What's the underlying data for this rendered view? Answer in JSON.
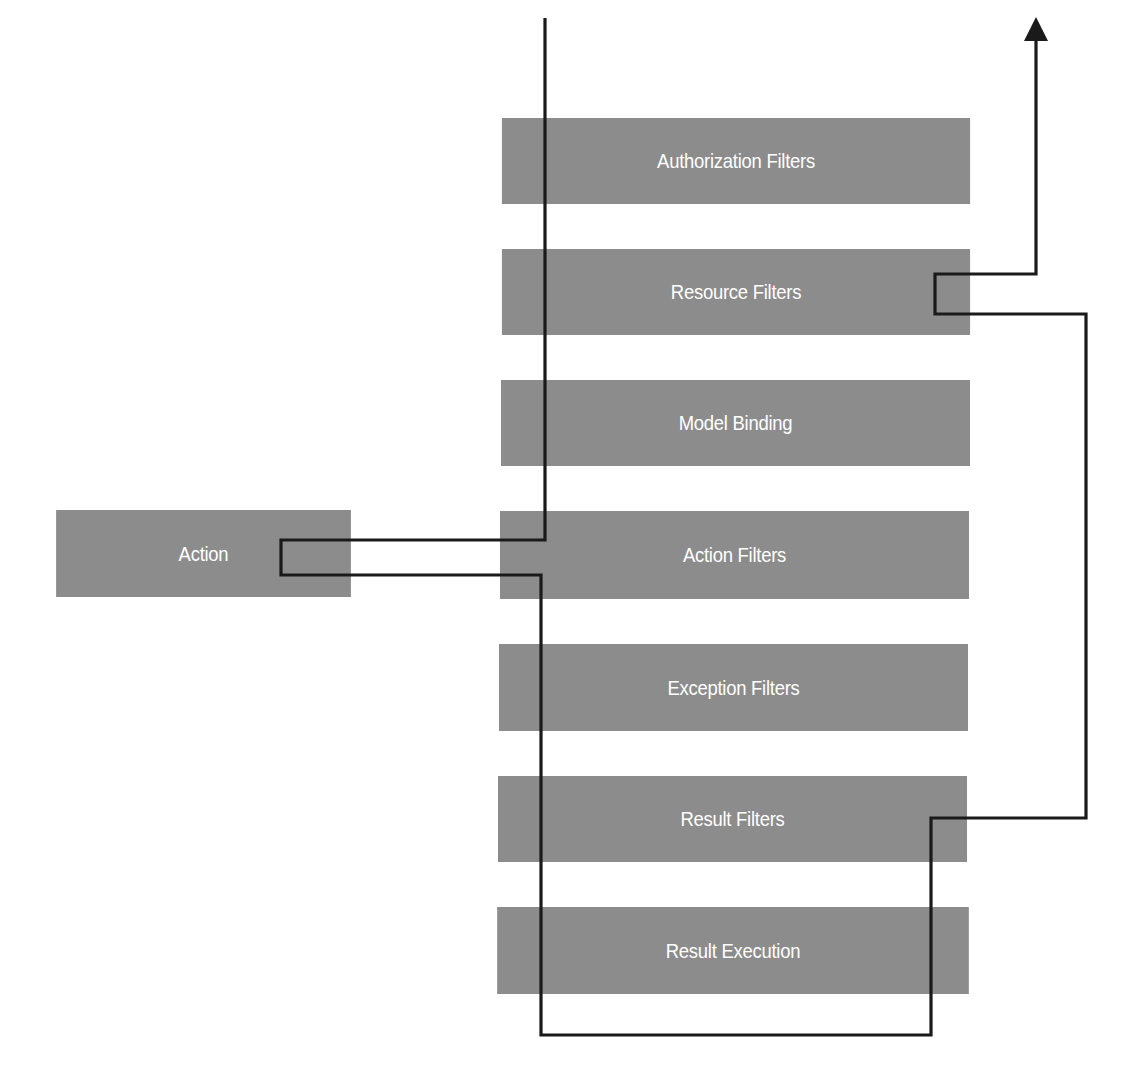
{
  "diagram": {
    "title": "",
    "pipeline_stages": [
      {
        "id": "authorization",
        "label": "Authorization Filters"
      },
      {
        "id": "resource",
        "label": "Resource Filters"
      },
      {
        "id": "model-binding",
        "label": "Model Binding"
      },
      {
        "id": "action-filters",
        "label": "Action Filters"
      },
      {
        "id": "exception",
        "label": "Exception Filters"
      },
      {
        "id": "result-filters",
        "label": "Result Filters"
      },
      {
        "id": "result-execution",
        "label": "Result Execution"
      }
    ],
    "side_node": {
      "id": "action",
      "label": "Action"
    },
    "colors": {
      "box_fill": "#8c8c8c",
      "box_text": "#ffffff",
      "flow_line": "#1a1a1a",
      "background": "#ffffff"
    },
    "flow": {
      "direction": "request enters top, flows down through Authorization, Resource, Model Binding, Action Filters to Action; returns through Action Filters, Exception, Result Filters, Result Execution; then back up through Result Filters and Resource Filters and exits top-right",
      "exit_marker": "arrow-up"
    }
  }
}
